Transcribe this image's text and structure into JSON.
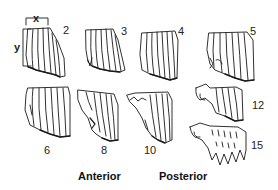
{
  "diagram": {
    "dimension_labels": {
      "x": "x",
      "y": "y"
    },
    "specimens": [
      {
        "id": "2",
        "label": "2",
        "row": "top"
      },
      {
        "id": "3",
        "label": "3",
        "row": "top"
      },
      {
        "id": "4",
        "label": "4",
        "row": "top"
      },
      {
        "id": "5",
        "label": "5",
        "row": "top"
      },
      {
        "id": "6",
        "label": "6",
        "row": "bottom"
      },
      {
        "id": "8",
        "label": "8",
        "row": "bottom"
      },
      {
        "id": "10",
        "label": "10",
        "row": "bottom"
      },
      {
        "id": "12",
        "label": "12",
        "row": "right"
      },
      {
        "id": "15",
        "label": "15",
        "row": "right"
      }
    ],
    "region_labels": {
      "anterior": "Anterior",
      "posterior": "Posterior"
    },
    "colors": {
      "line": "#1a1a1a",
      "background": "#ffffff"
    }
  }
}
